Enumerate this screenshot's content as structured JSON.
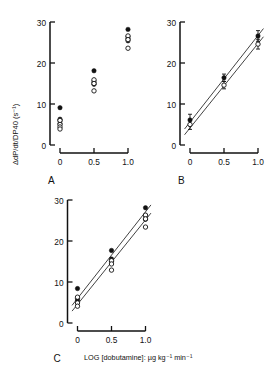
{
  "figure": {
    "y_axis_label": "ΔdP/dt/DP40 (s⁻¹)",
    "x_axis_label": "LOG [dobutamine]: µg kg⁻¹ min⁻¹",
    "panel_letters": {
      "a": "A",
      "b": "B",
      "c": "C"
    }
  },
  "axes": {
    "y_ticks": [
      "0",
      "10",
      "20",
      "30"
    ],
    "y_values": [
      0,
      10,
      20,
      30
    ],
    "x_ticks": [
      "0",
      "0.5",
      "1.0"
    ],
    "x_values": [
      0,
      0.5,
      1.0
    ],
    "ylim": [
      0,
      30
    ],
    "xlim": [
      -0.12,
      1.12
    ]
  },
  "chart_data": [
    {
      "id": "panel-a",
      "type": "scatter",
      "title": "A",
      "xlabel": "LOG [dobutamine]: µg kg⁻¹ min⁻¹",
      "ylabel": "ΔdP/dt/DP40 (s⁻¹)",
      "xlim": [
        -0.12,
        1.12
      ],
      "ylim": [
        0,
        30
      ],
      "xticks": [
        0,
        0.5,
        1.0
      ],
      "yticks": [
        0,
        10,
        20,
        30
      ],
      "grid": false,
      "legend": null,
      "regression_lines": [],
      "series": [
        {
          "name": "filled-circles",
          "marker": "filled-circle",
          "points": [
            {
              "x": 0.0,
              "y": 9.1
            },
            {
              "x": 0.0,
              "y": 6.3
            },
            {
              "x": 0.0,
              "y": 5.9
            },
            {
              "x": 0.0,
              "y": 5.2
            },
            {
              "x": 0.5,
              "y": 18.1
            },
            {
              "x": 0.5,
              "y": 15.6
            },
            {
              "x": 0.5,
              "y": 15.2
            },
            {
              "x": 0.5,
              "y": 14.8
            },
            {
              "x": 1.0,
              "y": 28.2
            },
            {
              "x": 1.0,
              "y": 26.4
            },
            {
              "x": 1.0,
              "y": 25.9
            },
            {
              "x": 1.0,
              "y": 25.4
            }
          ]
        },
        {
          "name": "open-circles",
          "marker": "open-circle",
          "points": [
            {
              "x": 0.0,
              "y": 6.0
            },
            {
              "x": 0.0,
              "y": 5.0
            },
            {
              "x": 0.0,
              "y": 4.4
            },
            {
              "x": 0.0,
              "y": 3.9
            },
            {
              "x": 0.5,
              "y": 15.9
            },
            {
              "x": 0.5,
              "y": 15.0
            },
            {
              "x": 0.5,
              "y": 13.2
            },
            {
              "x": 1.0,
              "y": 26.6
            },
            {
              "x": 1.0,
              "y": 25.7
            },
            {
              "x": 1.0,
              "y": 23.6
            }
          ]
        }
      ]
    },
    {
      "id": "panel-b",
      "type": "scatter",
      "title": "B",
      "xlabel": "LOG [dobutamine]: µg kg⁻¹ min⁻¹",
      "ylabel": "ΔdP/dt/DP40 (s⁻¹)",
      "xlim": [
        -0.12,
        1.12
      ],
      "ylim": [
        0,
        30
      ],
      "xticks": [
        0,
        0.5,
        1.0
      ],
      "yticks": [
        0,
        10,
        20,
        30
      ],
      "grid": false,
      "legend": null,
      "series": [
        {
          "name": "filled-circles",
          "marker": "filled-circle",
          "points": [
            {
              "x": 0.0,
              "y": 6.1,
              "err": 1.4
            },
            {
              "x": 0.5,
              "y": 16.4,
              "err": 0.9
            },
            {
              "x": 1.0,
              "y": 26.6,
              "err": 1.3
            }
          ]
        },
        {
          "name": "open-circles",
          "marker": "open-circle",
          "points": [
            {
              "x": 0.0,
              "y": 5.0,
              "err": 1.2
            },
            {
              "x": 0.5,
              "y": 14.6,
              "err": 0.9
            },
            {
              "x": 1.0,
              "y": 24.6,
              "err": 1.2
            }
          ]
        }
      ],
      "regression_lines": [
        {
          "name": "filled-fit",
          "x0": -0.08,
          "y0": 3.9,
          "x1": 1.08,
          "y1": 28.4
        },
        {
          "name": "open-fit",
          "x0": -0.08,
          "y0": 2.5,
          "x1": 1.08,
          "y1": 26.4
        }
      ]
    },
    {
      "id": "panel-c",
      "type": "scatter",
      "title": "C",
      "xlabel": "LOG [dobutamine]: µg kg⁻¹ min⁻¹",
      "ylabel": "ΔdP/dt/DP40 (s⁻¹)",
      "xlim": [
        -0.12,
        1.12
      ],
      "ylim": [
        0,
        30
      ],
      "xticks": [
        0,
        0.5,
        1.0
      ],
      "yticks": [
        0,
        10,
        20,
        30
      ],
      "grid": false,
      "legend": null,
      "series": [
        {
          "name": "filled-circles",
          "marker": "filled-circle",
          "points": [
            {
              "x": 0.0,
              "y": 8.4
            },
            {
              "x": 0.0,
              "y": 6.0
            },
            {
              "x": 0.0,
              "y": 5.4
            },
            {
              "x": 0.5,
              "y": 17.7
            },
            {
              "x": 0.5,
              "y": 15.6
            },
            {
              "x": 0.5,
              "y": 15.0
            },
            {
              "x": 1.0,
              "y": 28.1
            },
            {
              "x": 1.0,
              "y": 26.2
            },
            {
              "x": 1.0,
              "y": 25.3
            }
          ]
        },
        {
          "name": "open-circles",
          "marker": "open-circle",
          "points": [
            {
              "x": 0.0,
              "y": 6.3
            },
            {
              "x": 0.0,
              "y": 4.9
            },
            {
              "x": 0.0,
              "y": 4.1
            },
            {
              "x": 0.5,
              "y": 15.2
            },
            {
              "x": 0.5,
              "y": 14.4
            },
            {
              "x": 0.5,
              "y": 12.9
            },
            {
              "x": 1.0,
              "y": 26.3
            },
            {
              "x": 1.0,
              "y": 25.4
            },
            {
              "x": 1.0,
              "y": 23.4
            }
          ]
        }
      ],
      "regression_lines": [
        {
          "name": "filled-fit",
          "x0": -0.08,
          "y0": 4.3,
          "x1": 1.08,
          "y1": 28.8
        },
        {
          "name": "open-fit",
          "x0": -0.08,
          "y0": 2.9,
          "x1": 1.08,
          "y1": 26.8
        }
      ]
    }
  ]
}
